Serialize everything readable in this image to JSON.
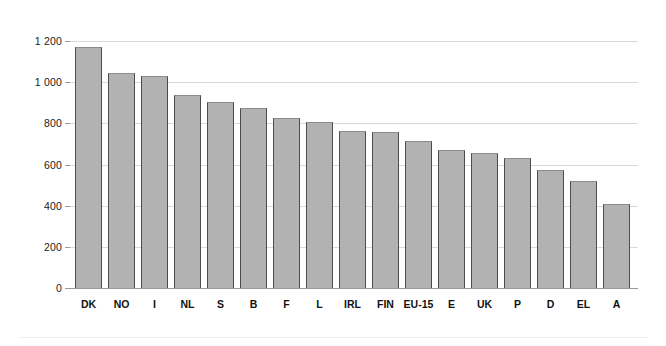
{
  "chart_data": {
    "type": "bar",
    "title": "",
    "subtitle": "",
    "xlabel": "",
    "ylabel": "",
    "ylim": [
      0,
      1200
    ],
    "ytick_step": 200,
    "ytick_labels": [
      "0",
      "200",
      "400",
      "600",
      "800",
      "1 000",
      "1 200"
    ],
    "ytick_values": [
      0,
      200,
      400,
      600,
      800,
      1000,
      1200
    ],
    "grid": "horizontal",
    "legend": "none",
    "thousands_separator": " ",
    "categories": [
      "DK",
      "NO",
      "I",
      "NL",
      "S",
      "B",
      "F",
      "L",
      "IRL",
      "FIN",
      "EU-15",
      "E",
      "UK",
      "P",
      "D",
      "EL",
      "A"
    ],
    "values": [
      1170,
      1045,
      1030,
      940,
      905,
      875,
      825,
      805,
      765,
      760,
      715,
      670,
      655,
      630,
      575,
      520,
      410
    ],
    "series": [
      {
        "name": "",
        "color": "#b2b2b2",
        "values": [
          1170,
          1045,
          1030,
          940,
          905,
          875,
          825,
          805,
          765,
          760,
          715,
          670,
          655,
          630,
          575,
          520,
          410
        ]
      }
    ]
  },
  "style": {
    "bar_fill": "#b2b2b2",
    "bar_edge": "#4d4d4d",
    "gridline_color": "#d9d9d9",
    "axis_color": "#9a9a9a",
    "background": "#ffffff",
    "text_color": "#111111"
  }
}
